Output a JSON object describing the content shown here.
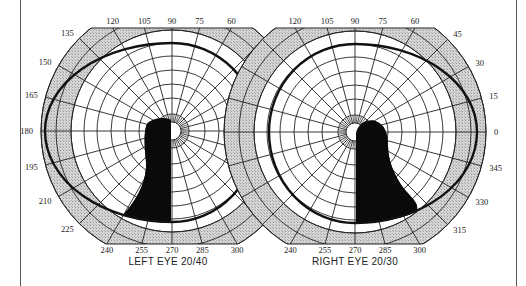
{
  "chart_data": [
    {
      "type": "polar-visual-field",
      "title": "LEFT EYE",
      "acuity": "20/40",
      "caption": "LEFT EYE  20/40",
      "center_px": [
        172,
        131
      ],
      "outer_radius_px": 131,
      "angle_ticks_deg": [
        120,
        105,
        90,
        75,
        60,
        135,
        150,
        165,
        180,
        195,
        210,
        225,
        240,
        255,
        270,
        285,
        300
      ],
      "radial_line_step_deg": 15,
      "ring_radii_px": [
        9,
        17,
        33,
        47,
        61,
        75,
        88,
        101,
        116,
        131
      ],
      "shaded_band_px": [
        101,
        131
      ],
      "clip_y_px": [
        28,
        244
      ],
      "isopter": {
        "rx_left": 127,
        "rx_right": 86,
        "ry_top": 88,
        "ry_bottom": 91
      },
      "scotoma": {
        "description": "dense inferior defect extending from fixation down to 255-270 deg",
        "path": "M171,120 C165,117 152,118 147,124 C143,132 145,150 146,162 C147,178 140,196 124,214 C134,219 150,222 171,223 Z"
      }
    },
    {
      "type": "polar-visual-field",
      "title": "RIGHT EYE",
      "acuity": "20/30",
      "caption": "RIGHT EYE  20/30",
      "center_px": [
        355,
        132
      ],
      "outer_radius_px": 131,
      "angle_ticks_deg": [
        120,
        105,
        90,
        75,
        60,
        45,
        30,
        15,
        0,
        345,
        330,
        315,
        240,
        255,
        270,
        285,
        300
      ],
      "radial_line_step_deg": 15,
      "ring_radii_px": [
        9,
        17,
        33,
        47,
        61,
        75,
        88,
        101,
        116,
        131
      ],
      "shaded_band_px": [
        101,
        131
      ],
      "clip_y_px": [
        28,
        244
      ],
      "isopter": {
        "rx_left": 86,
        "rx_right": 122,
        "ry_top": 88,
        "ry_bottom": 91
      },
      "scotoma": {
        "description": "dense inferior defect from fixation down to 270-300 deg",
        "path": "M356,133 C358,124 366,119 375,121 C385,124 388,134 388,146 C388,160 394,176 405,190 C414,200 420,205 416,212 C400,219 378,223 356,223 Z"
      }
    }
  ],
  "left_eye": {
    "caption": "LEFT EYE  20/40"
  },
  "right_eye": {
    "caption": "RIGHT EYE  20/30"
  }
}
